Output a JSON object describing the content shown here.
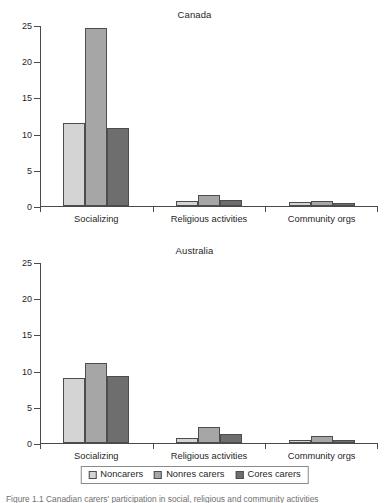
{
  "figure": {
    "caption": "Figure 1.1  Canadian carers' participation in social, religious and community activities",
    "legend": {
      "items": [
        {
          "label": "Noncarers",
          "color": "#d4d4d4"
        },
        {
          "label": "Nonres carers",
          "color": "#a6a6a6"
        },
        {
          "label": "Cores carers",
          "color": "#6e6e6e"
        }
      ]
    }
  },
  "chart_data": [
    {
      "type": "bar",
      "title": "Canada",
      "xlabel": "",
      "ylabel": "",
      "ylim": [
        0,
        25
      ],
      "yticks": [
        0,
        5,
        10,
        15,
        20,
        25
      ],
      "ytick_labels": [
        "0",
        "5",
        "10",
        "15",
        "20",
        "25"
      ],
      "grid": false,
      "legend_position": "bottom",
      "categories": [
        "Socializing",
        "Religious activities",
        "Community orgs"
      ],
      "series": [
        {
          "name": "Noncarers",
          "color": "#d4d4d4",
          "values": [
            11.5,
            0.7,
            0.5
          ]
        },
        {
          "name": "Nonres carers",
          "color": "#a6a6a6",
          "values": [
            24.6,
            1.5,
            0.7
          ]
        },
        {
          "name": "Cores carers",
          "color": "#6e6e6e",
          "values": [
            10.8,
            0.8,
            0.4
          ]
        }
      ]
    },
    {
      "type": "bar",
      "title": "Australia",
      "xlabel": "",
      "ylabel": "",
      "ylim": [
        0,
        25
      ],
      "yticks": [
        0,
        5,
        10,
        15,
        20,
        25
      ],
      "ytick_labels": [
        "0",
        "5",
        "10",
        "15",
        "20",
        "25"
      ],
      "grid": false,
      "legend_position": "bottom",
      "categories": [
        "Socializing",
        "Religious activities",
        "Community orgs"
      ],
      "series": [
        {
          "name": "Noncarers",
          "color": "#d4d4d4",
          "values": [
            9.0,
            0.7,
            0.4
          ]
        },
        {
          "name": "Nonres carers",
          "color": "#a6a6a6",
          "values": [
            11.0,
            2.2,
            1.0
          ]
        },
        {
          "name": "Cores carers",
          "color": "#6e6e6e",
          "values": [
            9.2,
            1.2,
            0.4
          ]
        }
      ]
    }
  ]
}
